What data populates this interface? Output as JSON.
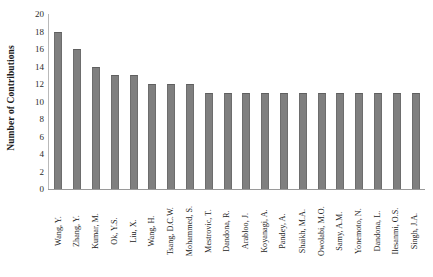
{
  "chart_data": {
    "type": "bar",
    "title": "",
    "xlabel": "",
    "ylabel": "Number of Contributions",
    "ylim": [
      0,
      20
    ],
    "ytick_step": 2,
    "yticks": [
      20,
      18,
      16,
      14,
      12,
      10,
      8,
      6,
      4,
      2,
      0
    ],
    "grid": false,
    "legend": null,
    "bar_color": "#7f7f7f",
    "bar_edge_color": "#6d6d6d",
    "axis_color": "#9a9a9a",
    "categories": [
      "Wang, Y.",
      "Zhang, Y.",
      "Kumar, M.",
      "Ok, Y.S.",
      "Liu, X.",
      "Wang, H.",
      "Tsang, D.C.W.",
      "Mohammed, S.",
      "Mestrovic, T.",
      "Dandona, R.",
      "Arabloo, J.",
      "Koyanagi, A.",
      "Pandey, A.",
      "Shaikh, M.A.",
      "Owolabi, M.O.",
      "Samy, A.M.",
      "Yonemoto, N.",
      "Dandona, L.",
      "Ilesanmi, O.S.",
      "Singh, J.A."
    ],
    "values": [
      18,
      16,
      14,
      13,
      13,
      12,
      12,
      12,
      11,
      11,
      11,
      11,
      11,
      11,
      11,
      11,
      11,
      11,
      11,
      11
    ]
  }
}
